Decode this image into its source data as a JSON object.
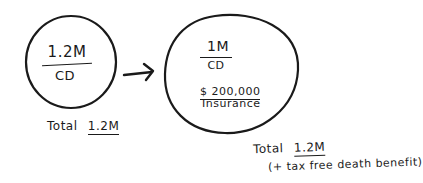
{
  "diagram": {
    "left_circle": {
      "amount": "1.2M",
      "label": "CD",
      "total_label": "Total",
      "total_value": "1.2M"
    },
    "arrow": {
      "icon": "arrow-right-icon"
    },
    "right_circle": {
      "amount": "1M",
      "label": "CD",
      "insurance_amount": "$ 200,000",
      "insurance_label": "Insurance",
      "total_label": "Total",
      "total_value": "1.2M",
      "note": "(+ tax free death benefit)"
    },
    "colors": {
      "ink": "#1a1a1a",
      "paper": "#ffffff"
    }
  }
}
